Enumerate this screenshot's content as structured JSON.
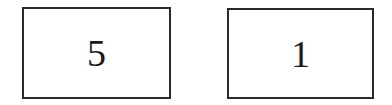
{
  "boxes": [
    {
      "value": "5"
    },
    {
      "value": "1"
    }
  ],
  "colors": {
    "border": "#2a2a2a",
    "text": "#1a1a1a",
    "background": "#ffffff"
  }
}
